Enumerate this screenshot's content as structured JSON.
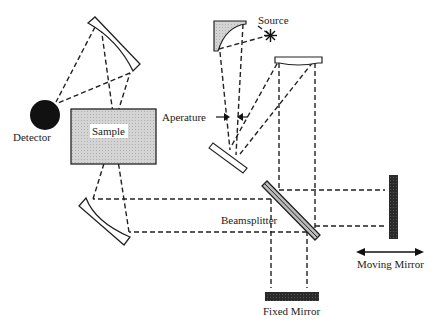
{
  "diagram": {
    "labels": {
      "source": "Source",
      "detector": "Detector",
      "sample": "Sample",
      "aperture": "Aperature",
      "beamsplitter": "Beamsplitter",
      "moving_mirror": "Moving Mirror",
      "fixed_mirror": "Fixed Mirror"
    },
    "colors": {
      "line": "#222222",
      "sample_fill": "#cfcfcf",
      "mirror_dark": "#2a2a2a",
      "background": "#ffffff"
    }
  }
}
